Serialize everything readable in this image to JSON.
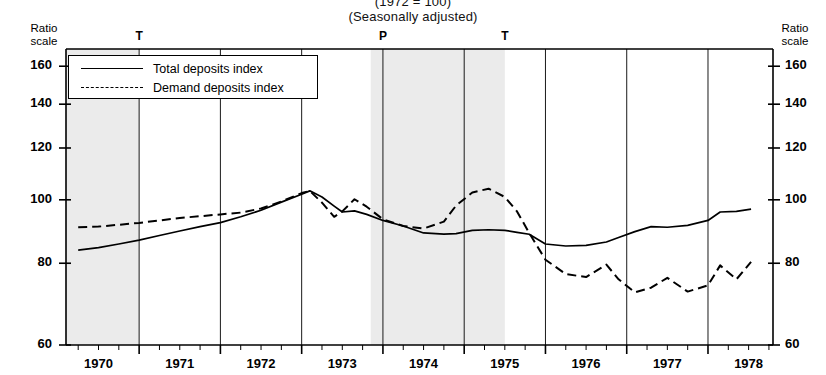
{
  "title": {
    "index_base": "(1972 = 100)",
    "seasonal": "(Seasonally adjusted)"
  },
  "axis_corner_labels": {
    "left": "Ratio\nscale",
    "left_line1": "Ratio",
    "left_line2": "scale",
    "right_line1": "Ratio",
    "right_line2": "scale"
  },
  "legend": {
    "total_label": "Total deposits index",
    "demand_label": "Demand deposits index"
  },
  "cycle_markers": [
    {
      "label": "T",
      "x_value": 1970.5
    },
    {
      "label": "P",
      "x_value": 1973.5
    },
    {
      "label": "T",
      "x_value": 1975.0
    }
  ],
  "chart_data": {
    "type": "line",
    "title": "(1972 = 100)",
    "subtitle": "(Seasonally adjusted)",
    "xlabel": "",
    "ylabel": "Ratio scale",
    "yscale": "log",
    "ylim": [
      60,
      170
    ],
    "xlim": [
      1969.6,
      1978.3
    ],
    "ytick_labels": [
      "60",
      "80",
      "100",
      "120",
      "140",
      "160"
    ],
    "yticks": [
      60,
      80,
      100,
      120,
      140,
      160
    ],
    "xtick_labels": [
      "1970",
      "1971",
      "1972",
      "1973",
      "1974",
      "1975",
      "1976",
      "1977",
      "1978"
    ],
    "xticks": [
      1970,
      1971,
      1972,
      1973,
      1974,
      1975,
      1976,
      1977,
      1978
    ],
    "grid": "vertical year boundaries at mid-year",
    "legend_position": "upper-left inside plot",
    "shaded_regions": [
      {
        "x_start": 1969.6,
        "x_end": 1970.5,
        "label": "recession"
      },
      {
        "x_start": 1973.35,
        "x_end": 1975.0,
        "label": "recession"
      }
    ],
    "series": [
      {
        "name": "Total deposits index",
        "style": "solid",
        "x": [
          1969.75,
          1970.0,
          1970.25,
          1970.5,
          1970.75,
          1971.0,
          1971.25,
          1971.5,
          1971.75,
          1972.0,
          1972.25,
          1972.5,
          1972.6,
          1972.75,
          1972.9,
          1973.0,
          1973.15,
          1973.3,
          1973.5,
          1973.75,
          1974.0,
          1974.25,
          1974.4,
          1974.6,
          1974.8,
          1975.0,
          1975.15,
          1975.3,
          1975.5,
          1975.75,
          1976.0,
          1976.25,
          1976.4,
          1976.6,
          1976.8,
          1977.0,
          1977.25,
          1977.5,
          1977.65,
          1977.85
        ],
        "values": [
          83.8,
          84.5,
          85.6,
          86.8,
          88.2,
          89.6,
          91.0,
          92.3,
          94.2,
          96.4,
          99.2,
          102.0,
          103.2,
          101.0,
          97.8,
          95.8,
          96.2,
          95.0,
          93.0,
          91.2,
          89.0,
          88.6,
          88.8,
          89.8,
          90.0,
          89.8,
          89.2,
          88.6,
          85.6,
          85.0,
          85.2,
          86.2,
          87.6,
          89.4,
          91.0,
          90.8,
          91.4,
          93.0,
          95.8,
          96.0
        ],
        "end_value": 96.8
      },
      {
        "name": "Demand deposits index",
        "style": "dashed",
        "x": [
          1969.75,
          1970.0,
          1970.25,
          1970.5,
          1970.75,
          1971.0,
          1971.25,
          1971.5,
          1971.75,
          1972.0,
          1972.25,
          1972.5,
          1972.6,
          1972.75,
          1972.9,
          1973.0,
          1973.15,
          1973.3,
          1973.5,
          1973.75,
          1974.0,
          1974.25,
          1974.4,
          1974.6,
          1974.8,
          1975.0,
          1975.15,
          1975.3,
          1975.5,
          1975.75,
          1976.0,
          1976.25,
          1976.4,
          1976.6,
          1976.8,
          1977.0,
          1977.25,
          1977.5,
          1977.65,
          1977.85
        ],
        "values": [
          90.8,
          91.0,
          91.6,
          92.2,
          93.0,
          93.8,
          94.4,
          95.0,
          95.6,
          97.0,
          99.4,
          102.4,
          103.2,
          99.0,
          94.2,
          96.0,
          100.2,
          97.6,
          93.4,
          91.2,
          90.4,
          92.6,
          98.0,
          102.6,
          104.0,
          101.0,
          96.0,
          89.0,
          81.0,
          77.0,
          76.2,
          79.6,
          75.6,
          72.2,
          73.4,
          76.0,
          72.4,
          74.0,
          79.4,
          75.6
        ],
        "end_value": 80.4
      }
    ]
  }
}
